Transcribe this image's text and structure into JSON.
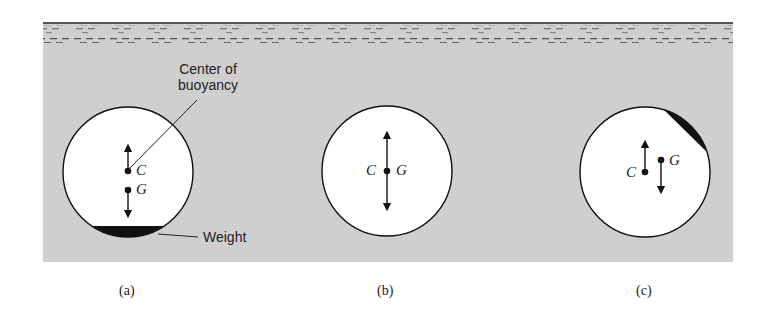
{
  "figure": {
    "background_color": "#cfcfcf",
    "panels": [
      {
        "id": "a",
        "caption": "(a)",
        "labels": {
          "center": "C",
          "gravity": "G"
        },
        "annotations": {
          "buoyancy": "Center of buoyancy",
          "buoyancy_line1": "Center of",
          "buoyancy_line2": "buoyancy",
          "weight": "Weight"
        }
      },
      {
        "id": "b",
        "caption": "(b)",
        "labels": {
          "center": "C",
          "gravity": "G"
        }
      },
      {
        "id": "c",
        "caption": "(c)",
        "labels": {
          "center": "C",
          "gravity": "G"
        }
      }
    ]
  }
}
